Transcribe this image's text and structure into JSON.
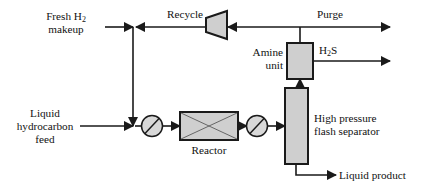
{
  "diagram": {
    "type": "process-flow-diagram",
    "colors": {
      "line": "#1a1a1a",
      "equipment_fill": "#cfcfcf",
      "background": "#ffffff"
    },
    "labels": {
      "fresh_h2_line1": "Fresh H",
      "fresh_h2_sub": "2",
      "fresh_h2_line2": "makeup",
      "recycle": "Recycle",
      "purge": "Purge",
      "amine_line1": "Amine",
      "amine_line2": "unit",
      "h2s_main": "H",
      "h2s_sub": "2",
      "h2s_tail": "S",
      "liquid_feed_line1": "Liquid",
      "liquid_feed_line2": "hydrocarbon",
      "liquid_feed_line3": "feed",
      "reactor": "Reactor",
      "separator_line1": "High pressure",
      "separator_line2": "flash separator",
      "liquid_product": "Liquid product"
    },
    "equipment": [
      {
        "id": "compressor",
        "name": "recycle-compressor",
        "shape": "trapezoid"
      },
      {
        "id": "amine-unit",
        "name": "amine-unit",
        "shape": "rectangle"
      },
      {
        "id": "reactor",
        "name": "reactor",
        "shape": "rectangle-with-x"
      },
      {
        "id": "flash-separator",
        "name": "high-pressure-flash-separator",
        "shape": "tall-rectangle"
      },
      {
        "id": "heater-1",
        "name": "feed-heater",
        "shape": "circle-with-slash"
      },
      {
        "id": "heater-2",
        "name": "effluent-cooler",
        "shape": "circle-with-slash"
      }
    ],
    "streams": [
      {
        "name": "fresh-hydrogen-makeup",
        "from": "feed-inlet",
        "to": "mixing-tee"
      },
      {
        "name": "recycle-gas",
        "from": "compressor",
        "to": "mixing-tee"
      },
      {
        "name": "purge-gas",
        "from": "recycle-header",
        "to": "purge-outlet"
      },
      {
        "name": "hydrogen-sulfide",
        "from": "amine-unit",
        "to": "h2s-outlet"
      },
      {
        "name": "liquid-hydrocarbon-feed",
        "from": "feed-inlet",
        "to": "mixing-tee"
      },
      {
        "name": "reactor-feed",
        "from": "heater-1",
        "to": "reactor"
      },
      {
        "name": "reactor-effluent",
        "from": "reactor",
        "to": "heater-2"
      },
      {
        "name": "separator-feed",
        "from": "heater-2",
        "to": "flash-separator"
      },
      {
        "name": "separator-overhead",
        "from": "flash-separator",
        "to": "amine-unit"
      },
      {
        "name": "liquid-product",
        "from": "flash-separator",
        "to": "product-outlet"
      }
    ]
  }
}
